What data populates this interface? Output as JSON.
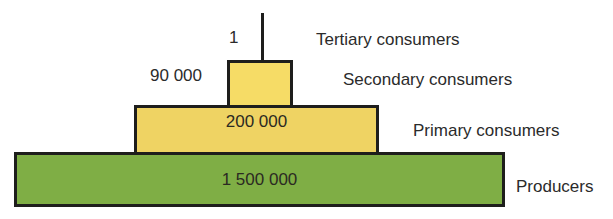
{
  "colors": {
    "producers": "#7fae45",
    "consumers": "#f2d562",
    "secondary": "#f6dc66",
    "outline": "#1e1e1c"
  },
  "levels": [
    {
      "name": "Tertiary consumers",
      "count": "1"
    },
    {
      "name": "Secondary consumers",
      "count": "90 000"
    },
    {
      "name": "Primary consumers",
      "count": "200 000"
    },
    {
      "name": "Producers",
      "count": "1 500 000"
    }
  ]
}
